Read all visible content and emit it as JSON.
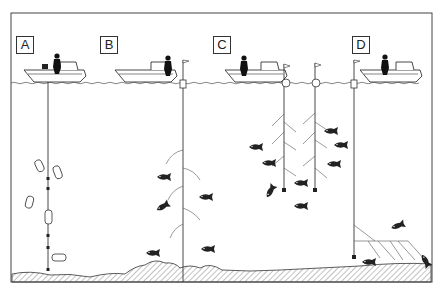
{
  "diagram": {
    "panels": [
      {
        "id": "A",
        "label": "A",
        "x": 16
      },
      {
        "id": "B",
        "label": "B",
        "x": 100
      },
      {
        "id": "C",
        "label": "C",
        "x": 213
      },
      {
        "id": "D",
        "label": "D",
        "x": 352
      }
    ],
    "colors": {
      "ink": "#222222",
      "frame": "#444444",
      "background": "#ffffff",
      "seabed_hatch": "#555555"
    }
  }
}
